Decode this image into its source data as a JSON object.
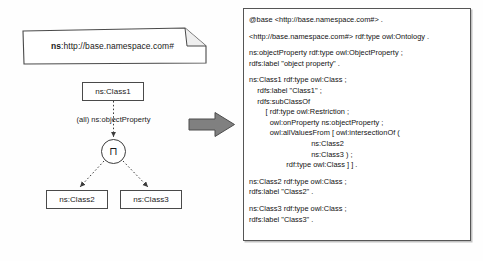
{
  "figure": {
    "kind": "ontology-diagram-with-turtle-code"
  },
  "diagram": {
    "namespace_note": {
      "prefix": "ns",
      "separator": ": ",
      "uri": "http://base.namespace.com#",
      "full": "ns: http://base.namespace.com#"
    },
    "nodes": {
      "class1": "ns:Class1",
      "class2": "ns:Class2",
      "class3": "ns:Class3"
    },
    "property_edge_label": "(all) ns:objectProperty",
    "intersection_symbol": "⊓",
    "arrow_symbol": "right-arrow"
  },
  "code": {
    "title": "turtle-source",
    "lines": [
      "@base <http://base.namespace.com#> .",
      "",
      "<http://base.namespace.com#> rdf:type owl:Ontology .",
      "",
      "ns:objectProperty rdf:type owl:ObjectProperty ;",
      "rdfs:label \"object property\" .",
      "",
      "ns:Class1 rdf:type owl:Class ;",
      "    rdfs:label \"Class1\" ;",
      "    rdfs:subClassOf",
      "        [ rdf:type owl:Restriction ;",
      "          owl:onProperty ns:objectProperty ;",
      "          owl:allValuesFrom [ owl:intersectionOf (",
      "                              ns:Class2",
      "                              ns:Class3 ) ;",
      "                  rdf:type owl:Class ] ] .",
      "",
      "ns:Class2 rdf:type owl:Class ;",
      "rdfs:label \"Class2\" .",
      "",
      "ns:Class3 rdf:type owl:Class ;",
      "rdfs:label \"Class3\" ."
    ]
  },
  "colors": {
    "stroke": "#4a4a4a",
    "arrow_fill": "#808080",
    "panel_border": "#555555",
    "background": "#fefefe"
  }
}
